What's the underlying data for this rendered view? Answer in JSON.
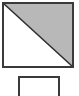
{
  "figure": {
    "canvas": {
      "width": 79,
      "height": 96,
      "background": "#ffffff"
    },
    "shapes": [
      {
        "id": "split-square",
        "name": "square-split-by-diagonal",
        "type": "square",
        "x": 2,
        "y": 2,
        "width": 72,
        "height": 66,
        "stroke": "#3a3a3a",
        "stroke_width": 2,
        "fill": "#ffffff",
        "diagonal": {
          "name": "diagonal-top-left-to-bottom-right",
          "from": "top-left",
          "to": "bottom-right",
          "stroke": "#2e2e2e",
          "stroke_width": 1.6
        },
        "regions": [
          {
            "name": "lower-left-triangle",
            "fill": "#ffffff",
            "label": ""
          },
          {
            "name": "upper-right-triangle",
            "fill": "#b8b8b8",
            "label": ""
          }
        ]
      },
      {
        "id": "small-rectangle",
        "name": "small-empty-rectangle",
        "type": "rectangle",
        "x": 18,
        "y": 76,
        "width": 42,
        "height": 20,
        "stroke": "#3a3a3a",
        "stroke_width": 2,
        "fill": "#ffffff",
        "clipped_at_bottom": true
      }
    ]
  }
}
